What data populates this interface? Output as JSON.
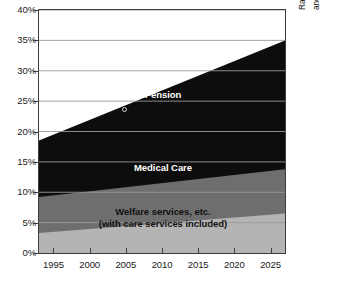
{
  "chart_data": {
    "type": "area",
    "stacked": true,
    "title": "",
    "xlabel": "",
    "ylabel": "",
    "xlim": [
      1993,
      2027
    ],
    "ylim": [
      0,
      40
    ],
    "grid": true,
    "legend_position": "in-plot",
    "x_ticks": [
      1995,
      2000,
      2005,
      2010,
      2015,
      2020,
      2025
    ],
    "x_tick_labels": [
      "1995",
      "2000",
      "2005",
      "2010",
      "2015",
      "2020",
      "2025"
    ],
    "y_ticks": [
      0,
      5,
      10,
      15,
      20,
      25,
      30,
      35,
      40
    ],
    "y_tick_labels": [
      "0%",
      "5%",
      "10%",
      "15%",
      "20%",
      "25%",
      "30%",
      "35%",
      "40%"
    ],
    "x": [
      1993,
      2027
    ],
    "series": [
      {
        "name": "Welfare services, etc. (with care services included)",
        "short_name": "Welfare services, etc.",
        "color": "#b4b4b4",
        "label_color": "#111111",
        "values": [
          3.3,
          6.5
        ]
      },
      {
        "name": "Medical Care",
        "short_name": "Medical Care",
        "color": "#6e6e6e",
        "label_color": "#ffffff",
        "values": [
          5.9,
          7.3
        ]
      },
      {
        "name": "Pension",
        "short_name": "Pension",
        "color": "#0d0d0d",
        "label_color": "#ffffff",
        "values": [
          9.3,
          21.2
        ]
      }
    ],
    "cumulative_top_values": {
      "welfare": [
        3.3,
        6.5
      ],
      "medical": [
        9.2,
        13.8
      ],
      "pension": [
        18.5,
        35.0
      ]
    },
    "annotations": [
      {
        "name": "side-note",
        "text": "Rates to the national income vary between 29% and 35.5% depending on economic growth rates.",
        "lines": [
          "Rates to the national income vary between 29%",
          "and 35.5% depending on economic growth rates."
        ],
        "orientation": "vertical"
      }
    ]
  },
  "labels": {
    "pension": "Pension",
    "medical": "Medical Care",
    "welfare_line1": "Welfare services, etc.",
    "welfare_line2": "(with care services included)"
  },
  "sidenote": {
    "line1": "Rates to the national income vary between 29%",
    "line2": "and 35.5% depending on economic growth rates."
  },
  "footnote": {
    "text": ""
  },
  "colors": {
    "pension": "#0d0d0d",
    "medical": "#6e6e6e",
    "welfare": "#b4b4b4",
    "grid": "#9a9a9a",
    "frame": "#3c3c3c",
    "text": "#1a1a1a"
  }
}
